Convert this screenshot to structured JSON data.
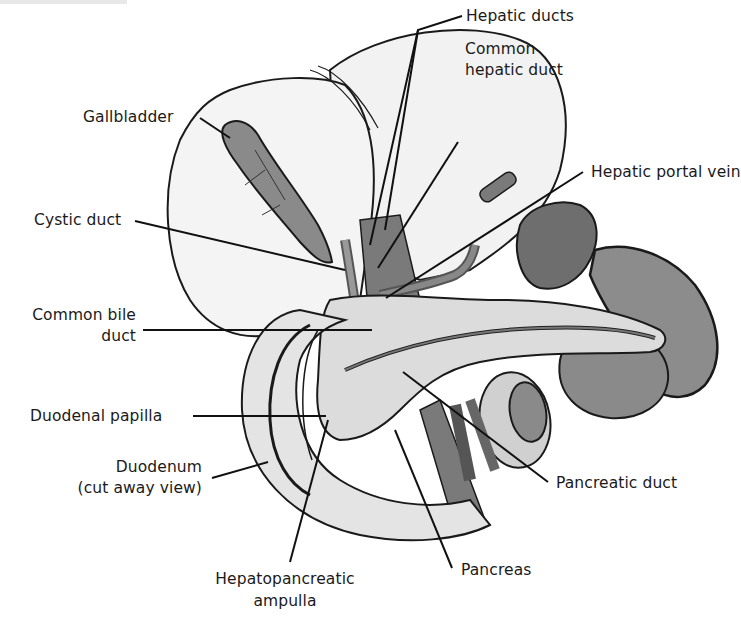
{
  "figure": {
    "colors": {
      "background": "#ffffff",
      "liver_fill": "#f1f1f1",
      "organ_dark_fill": "#7a7a7a",
      "organ_mid_fill": "#9a9a9a",
      "tissue_light_fill": "#d9d9d9",
      "outline": "#1a1a1a",
      "leader_line": "#111111"
    },
    "labels": {
      "gallbladder": "Gallbladder",
      "hepatic_ducts": "Hepatic ducts",
      "common_hepatic_duct_line1": "Common",
      "common_hepatic_duct_line2": "hepatic duct",
      "hepatic_portal_vein": "Hepatic portal vein",
      "cystic_duct": "Cystic duct",
      "common_bile_duct_line1": "Common bile",
      "common_bile_duct_line2": "duct",
      "duodenal_papilla": "Duodenal papilla",
      "duodenum_line1": "Duodenum",
      "duodenum_line2": "(cut away view)",
      "pancreatic_duct": "Pancreatic duct",
      "pancreas": "Pancreas",
      "hepatopancreatic_ampulla_line1": "Hepatopancreatic",
      "hepatopancreatic_ampulla_line2": "ampulla"
    }
  }
}
